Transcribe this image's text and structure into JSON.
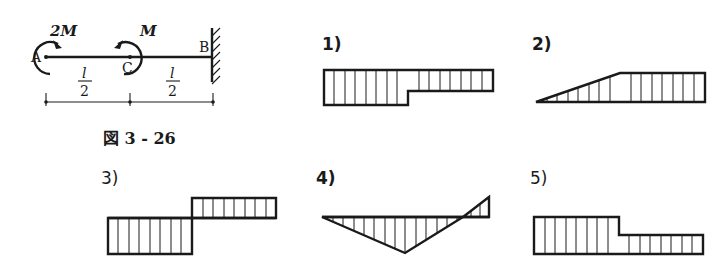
{
  "figure": {
    "caption": "図 3 - 26",
    "moment_A": "2M",
    "moment_C": "M",
    "point_A": "A",
    "point_B": "B",
    "point_C": "C",
    "span_AC": {
      "num": "l",
      "den": "2"
    },
    "span_CB": {
      "num": "l",
      "den": "2"
    },
    "moment_A_direction": "clockwise",
    "moment_C_direction": "counterclockwise",
    "support_B": "fixed wall"
  },
  "options": [
    {
      "label": "1)",
      "shape": "step, both negative side (below top line): larger left half, smaller right half"
    },
    {
      "label": "2)",
      "shape": "linear rise from 0 at left to constant value at midpoint, constant right half"
    },
    {
      "label": "3)",
      "shape": "left half below baseline, right half above baseline (equal magnitude)"
    },
    {
      "label": "4)",
      "shape": "triangle below baseline peaking at midpoint, crossing zero near right, small positive at right end"
    },
    {
      "label": "5)",
      "shape": "step above baseline: larger left half, smaller right half"
    }
  ]
}
